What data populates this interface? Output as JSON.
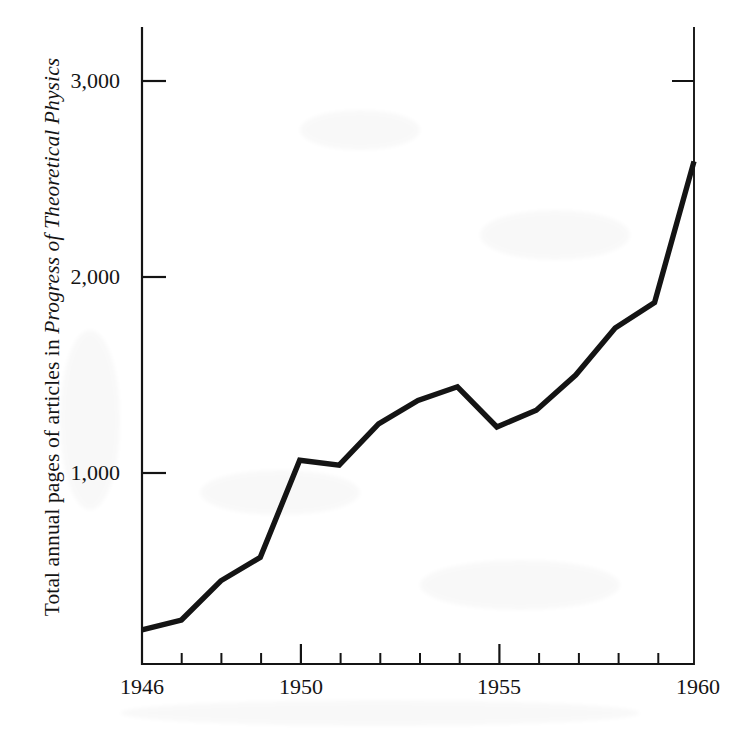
{
  "figure": {
    "kind": "line-graph",
    "ink_color": "#141414",
    "paper_color": "#ffffff"
  },
  "axis": {
    "y_title_prefix": "Total annual pages of articles in ",
    "y_title_italic": "Progress of Theoretical Physics",
    "y_tick_labels": [
      "3,000",
      "2,000",
      "1,000"
    ],
    "x_tick_labels": [
      "1946",
      "1950",
      "1955",
      "1960"
    ]
  },
  "chart_data": {
    "type": "line",
    "title": "",
    "subtitle": "",
    "xlabel": "",
    "ylabel": "Total annual pages of articles in Progress of Theoretical Physics",
    "xlim": [
      1946,
      1960
    ],
    "ylim": [
      0,
      3400
    ],
    "grid": false,
    "legend": "none",
    "x_major_ticks": [
      1950,
      1955
    ],
    "x_minor_ticks": [
      1947,
      1948,
      1949,
      1951,
      1952,
      1953,
      1954,
      1956,
      1957,
      1958,
      1959
    ],
    "x_labeled_ticks": [
      1946,
      1950,
      1955,
      1960
    ],
    "y_ticks": [
      1000,
      2000,
      3000
    ],
    "x": [
      1946,
      1947,
      1948,
      1949,
      1950,
      1951,
      1952,
      1953,
      1954,
      1955,
      1956,
      1957,
      1958,
      1959,
      1960
    ],
    "values": [
      200,
      250,
      450,
      570,
      1065,
      1040,
      1250,
      1370,
      1440,
      1235,
      1320,
      1500,
      1740,
      1870,
      2590
    ],
    "series": [
      {
        "name": "Total annual pages",
        "values": [
          200,
          250,
          450,
          570,
          1065,
          1040,
          1250,
          1370,
          1440,
          1235,
          1320,
          1500,
          1740,
          1870,
          2590
        ]
      }
    ]
  }
}
